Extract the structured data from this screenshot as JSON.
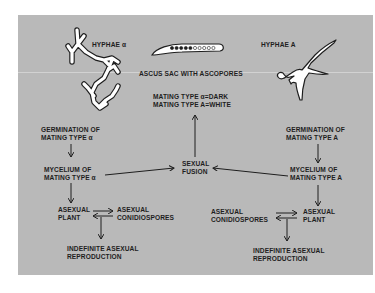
{
  "diagram": {
    "labels": {
      "hyphae_alpha": "HYPHAE α",
      "hyphae_A": "HYPHAE A",
      "ascus_sac": "ASCUS SAC WITH ASCOPORES",
      "mating_alpha_dark": "MATING TYPE α=DARK",
      "mating_A_white": "MATING TYPE A=WHITE",
      "sexual_fusion_1": "SEXUAL",
      "sexual_fusion_2": "FUSION",
      "germ_alpha_1": "GERMINATION OF",
      "germ_alpha_2": "MATING TYPE α",
      "myc_alpha_1": "MYCELIUM OF",
      "myc_alpha_2": "MATING TYPE α",
      "asex_plant_alpha_1": "ASEXUAL",
      "asex_plant_alpha_2": "PLANT",
      "conid_alpha_1": "ASEXUAL",
      "conid_alpha_2": "CONIDIOSPORES",
      "indef_alpha_1": "INDEFINITE ASEXUAL",
      "indef_alpha_2": "REPRODUCTION",
      "germ_A_1": "GERMINATION OF",
      "germ_A_2": "MATING TYPE A",
      "myc_A_1": "MYCELIUM OF",
      "myc_A_2": "MATING TYPE A",
      "conid_A_1": "ASEXUAL",
      "conid_A_2": "CONIDIOSPORES",
      "asex_plant_A_1": "ASEXUAL",
      "asex_plant_A_2": "PLANT",
      "indef_A_1": "INDEFINITE ASEXUAL",
      "indef_A_2": "REPRODUCTION"
    },
    "ascospores": {
      "dark_count": 5,
      "white_count": 5
    },
    "colors": {
      "panel": "#b9b9b9",
      "ink": "#1e1e1e",
      "hyphae_fill": "#ffffff"
    }
  }
}
